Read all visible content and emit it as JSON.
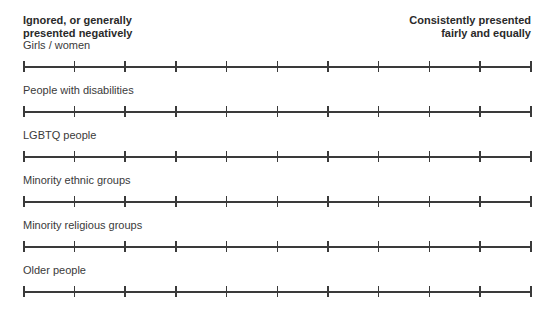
{
  "scale": {
    "left_anchor": {
      "line1": "Ignored, or generally",
      "line2": "presented negatively"
    },
    "right_anchor": {
      "line1": "Consistently presented",
      "line2": "fairly and equally"
    },
    "tick_count": 11,
    "line_color": "#3a3a3a"
  },
  "rows": [
    {
      "label": "Girls / women"
    },
    {
      "label": "People with disabilities"
    },
    {
      "label": "LGBTQ people"
    },
    {
      "label": "Minority ethnic groups"
    },
    {
      "label": "Minority religious groups"
    },
    {
      "label": "Older people"
    }
  ]
}
